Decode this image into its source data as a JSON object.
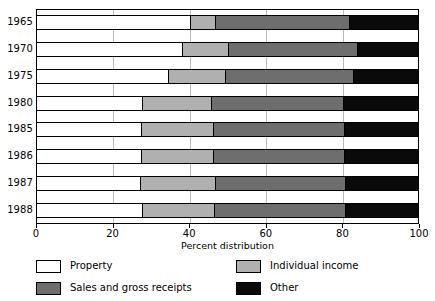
{
  "chart_data": {
    "type": "bar",
    "orientation": "horizontal",
    "stacked": true,
    "normalized": true,
    "title": "",
    "xlabel": "Percent distribution",
    "ylabel": "",
    "xlim": [
      0,
      100
    ],
    "xticks": [
      0,
      20,
      40,
      60,
      80,
      100
    ],
    "xticklabels": [
      "0",
      "20",
      "40",
      "60",
      "80",
      "100"
    ],
    "grid": "vertical",
    "legend_position": "below",
    "categories": [
      "1965",
      "1970",
      "1975",
      "1980",
      "1985",
      "1986",
      "1987",
      "1988"
    ],
    "series": [
      {
        "name": "Property",
        "color": "#ffffff",
        "values": [
          40.6,
          38.5,
          34.7,
          28.0,
          27.7,
          27.7,
          27.3,
          28.0
        ]
      },
      {
        "name": "Individual income",
        "color": "#b0b0b0",
        "values": [
          6.4,
          12.0,
          14.8,
          18.0,
          18.8,
          18.8,
          19.7,
          18.8
        ]
      },
      {
        "name": "Sales and gross receipts",
        "color": "#6e6e6e",
        "values": [
          35.0,
          33.5,
          33.5,
          34.5,
          34.2,
          34.2,
          34.0,
          34.2
        ]
      },
      {
        "name": "Other",
        "color": "#0a0a0a",
        "values": [
          18.0,
          16.0,
          17.0,
          19.5,
          19.3,
          19.3,
          19.0,
          19.0
        ]
      }
    ]
  },
  "axis": {
    "x_title": "Percent distribution",
    "tick_labels": [
      "0",
      "20",
      "40",
      "60",
      "80",
      "100"
    ],
    "year_labels": [
      "1965",
      "1970",
      "1975",
      "1980",
      "1985",
      "1986",
      "1987",
      "1988"
    ]
  },
  "legend": {
    "items": [
      {
        "label": "Property",
        "swatch": "property"
      },
      {
        "label": "Individual income",
        "swatch": "individual"
      },
      {
        "label": "Sales and gross receipts",
        "swatch": "sales"
      },
      {
        "label": "Other",
        "swatch": "other"
      }
    ]
  },
  "colors": {
    "property": "#ffffff",
    "individual_income": "#b0b0b0",
    "sales_and_gross_receipts": "#6e6e6e",
    "other": "#0a0a0a",
    "axis": "#000000",
    "gridline": "#b9b9b9",
    "background": "#ffffff"
  }
}
